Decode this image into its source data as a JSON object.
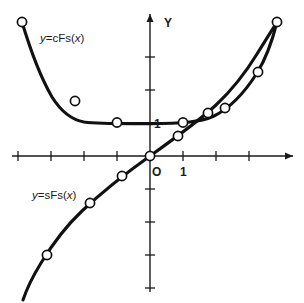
{
  "chart_data": {
    "type": "line",
    "title": "",
    "subtitle": "",
    "xlabel": "",
    "ylabel": "Y",
    "origin_label": "O",
    "grid": false,
    "legend_position": "inline-annotations",
    "xlim": [
      -3.95,
      4.6
    ],
    "ylim": [
      -4.25,
      4.1
    ],
    "x_tick_step": 1,
    "y_tick_step": 1,
    "x_axis_tick_labels": [
      "1"
    ],
    "y_axis_tick_labels": [
      "1"
    ],
    "x_label_value": 1,
    "y_label_value": 1,
    "series": [
      {
        "name": "y=cFs(x)",
        "label_text_prefix": "y",
        "label_text_body": "=cFs(",
        "label_text_var": "x",
        "label_text_suffix": ")",
        "function": "cosh",
        "x": [
          -3.9,
          -2.6,
          -1.3,
          0,
          1.3,
          2.6,
          3.9
        ],
        "y": [
          24.71,
          6.77,
          1.97,
          1.0,
          1.97,
          6.77,
          24.71
        ],
        "marker": "open-circle",
        "label_position": {
          "x": 40,
          "y": 38
        }
      },
      {
        "name": "y=sFs(x)",
        "label_text_prefix": "y",
        "label_text_body": "=sFs(",
        "label_text_var": "x",
        "label_text_suffix": ")",
        "function": "sinh",
        "x": [
          -3.9,
          -2.6,
          -1.3,
          0,
          1.3,
          2.6,
          3.9
        ],
        "y": [
          -24.69,
          -6.69,
          -1.7,
          0.0,
          1.7,
          6.69,
          24.69
        ],
        "marker": "open-circle",
        "label_position": {
          "x": 32,
          "y": 196
        }
      }
    ],
    "annotations": [
      {
        "text": "Y",
        "x": 163,
        "y": 22,
        "role": "y-axis-name"
      },
      {
        "text": "O",
        "x": 154,
        "y": 172,
        "role": "origin"
      },
      {
        "text": "1",
        "x": 182,
        "y": 172,
        "role": "x-unit"
      },
      {
        "text": "1",
        "x": 155,
        "y": 128,
        "role": "y-unit"
      }
    ]
  },
  "colors": {
    "background": "#ffffff",
    "axis": "#1a1a1a",
    "curve": "#111111",
    "marker_fill": "#ffffff",
    "marker_stroke": "#111111",
    "text": "#1a1a1a"
  },
  "labels": {
    "cosh_label_full": "y=cFs(x)",
    "sinh_label_full": "y=sFs(x)",
    "y_axis": "Y",
    "origin": "O",
    "x_unit": "1",
    "y_unit": "1"
  }
}
